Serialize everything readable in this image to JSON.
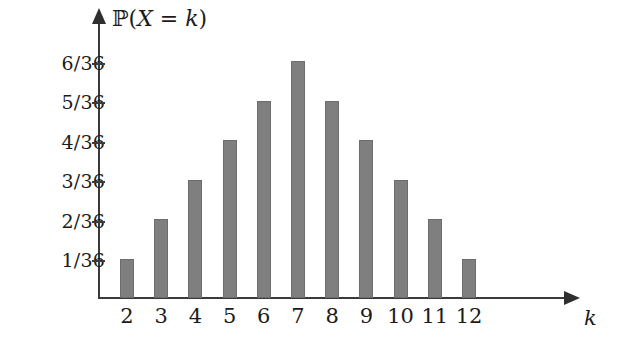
{
  "figure": {
    "background_color": "#ffffff",
    "bar_color": "#7f7f7f",
    "axis_color": "#3a3a3a",
    "text_color": "#1b1b1b"
  },
  "axis_titles": {
    "y_prefix": "ℙ(",
    "y_var": "X",
    "y_eq": " = ",
    "y_k": "k",
    "y_suffix": ")",
    "y_full": "ℙ(X = k)",
    "x": "k"
  },
  "chart_data": {
    "type": "bar",
    "title": "ℙ(X = k)",
    "xlabel": "k",
    "ylabel": "ℙ(X = k)",
    "categories": [
      "2",
      "3",
      "4",
      "5",
      "6",
      "7",
      "8",
      "9",
      "10",
      "11",
      "12"
    ],
    "values": [
      1,
      2,
      3,
      4,
      5,
      6,
      5,
      4,
      3,
      2,
      1
    ],
    "value_labels": [
      "1/36",
      "2/36",
      "3/36",
      "4/36",
      "5/36",
      "6/36",
      "5/36",
      "4/36",
      "3/36",
      "2/36",
      "1/36"
    ],
    "value_denominator": 36,
    "ytick_labels": [
      "1/36",
      "2/36",
      "3/36",
      "4/36",
      "5/36",
      "6/36"
    ],
    "ytick_values": [
      1,
      2,
      3,
      4,
      5,
      6
    ],
    "ylim": [
      0,
      6.6
    ],
    "xlim_categories": [
      "2",
      "12"
    ],
    "grid": false,
    "legend": null
  }
}
